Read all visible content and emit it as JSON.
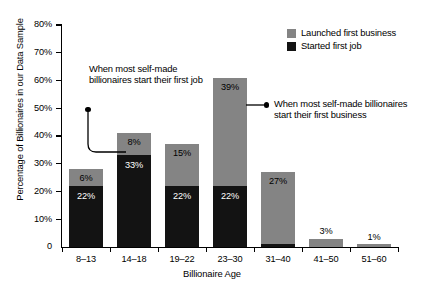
{
  "chart_data": {
    "type": "bar",
    "stacked": true,
    "title": "",
    "xlabel": "Billionaire Age",
    "ylabel": "Percentage of Billionaires in our Data Sample",
    "ylim": [
      0,
      80
    ],
    "ytick_values": [
      0,
      10,
      20,
      30,
      40,
      50,
      60,
      70,
      80
    ],
    "ytick_labels": [
      "0",
      "10%",
      "20%",
      "30%",
      "40%",
      "50%",
      "60%",
      "70%",
      "80%"
    ],
    "grid": false,
    "legend_position": "top-right",
    "categories": [
      "8–13",
      "14–18",
      "19–22",
      "23–30",
      "31–40",
      "41–50",
      "51–60"
    ],
    "series": [
      {
        "name": "Started first job",
        "color": "#131313",
        "values": [
          22,
          33,
          22,
          22,
          1,
          0,
          0
        ],
        "labels": [
          "22%",
          "33%",
          "22%",
          "22%",
          "",
          "",
          ""
        ]
      },
      {
        "name": "Launched first business",
        "color": "#848484",
        "values": [
          6,
          8,
          15,
          39,
          26,
          3,
          1
        ],
        "labels": [
          "6%",
          "8%",
          "15%",
          "39%",
          "27%",
          "3%",
          "1%"
        ]
      }
    ],
    "totals": [
      28,
      41,
      37,
      61,
      27,
      3,
      1
    ],
    "annotations": [
      {
        "id": "left",
        "text": "When most self-made billionaires start their first job",
        "points_to": "14–18"
      },
      {
        "id": "right",
        "text": "When most self-made billionaires start their first business",
        "points_to": "23–30"
      }
    ]
  },
  "legend": {
    "items": [
      {
        "label": "Launched first business",
        "color": "#848484"
      },
      {
        "label": "Started first job",
        "color": "#131313"
      }
    ]
  },
  "colors": {
    "business": "#848484",
    "job": "#131313",
    "axis": "#000000",
    "background": "#ffffff"
  }
}
